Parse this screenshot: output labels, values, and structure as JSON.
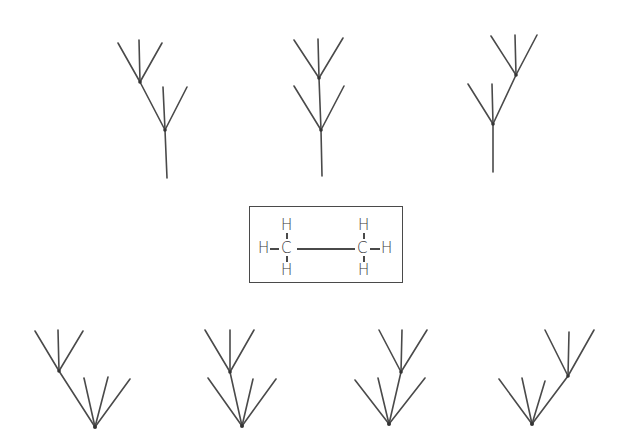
{
  "diagram": {
    "colors": {
      "line": "#4a4a4a",
      "background": "#ffffff"
    },
    "ethane": {
      "atoms": {
        "c_left": "C",
        "c_right": "C",
        "h_left_top": "H",
        "h_left_bottom": "H",
        "h_left_side": "H",
        "h_right_top": "H",
        "h_right_bottom": "H",
        "h_right_side": "H"
      }
    },
    "top_row_trees": [
      {
        "name": "tree-top-1",
        "nodes": 2,
        "branches": [
          3,
          2
        ]
      },
      {
        "name": "tree-top-2",
        "nodes": 2,
        "branches": [
          3,
          2
        ]
      },
      {
        "name": "tree-top-3",
        "nodes": 2,
        "branches": [
          3,
          2
        ]
      }
    ],
    "bottom_row_trees": [
      {
        "name": "tree-bottom-1",
        "nodes": 2,
        "branches": [
          3,
          3
        ]
      },
      {
        "name": "tree-bottom-2",
        "nodes": 2,
        "branches": [
          3,
          3
        ]
      },
      {
        "name": "tree-bottom-3",
        "nodes": 2,
        "branches": [
          3,
          3
        ]
      },
      {
        "name": "tree-bottom-4",
        "nodes": 2,
        "branches": [
          3,
          3
        ]
      }
    ]
  }
}
